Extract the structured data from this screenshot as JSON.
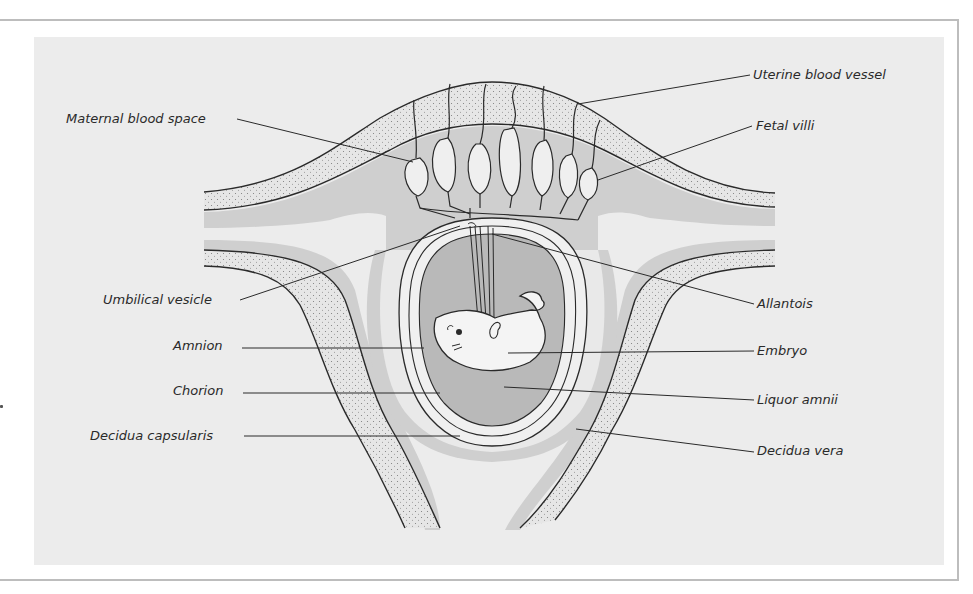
{
  "figure": {
    "type": "anatomical-diagram"
  },
  "labels": {
    "left": [
      {
        "id": "maternal_blood_space",
        "text": "Maternal blood space"
      },
      {
        "id": "umbilical_vesicle",
        "text": "Umbilical vesicle"
      },
      {
        "id": "amnion",
        "text": "Amnion"
      },
      {
        "id": "chorion",
        "text": "Chorion"
      },
      {
        "id": "decidua_capsularis",
        "text": "Decidua capsularis"
      }
    ],
    "right": [
      {
        "id": "uterine_blood_vessel",
        "text": "Uterine blood vessel"
      },
      {
        "id": "fetal_villi",
        "text": "Fetal villi"
      },
      {
        "id": "allantois",
        "text": "Allantois"
      },
      {
        "id": "embryo",
        "text": "Embryo"
      },
      {
        "id": "liquor_amnii",
        "text": "Liquor amnii"
      },
      {
        "id": "decidua_vera",
        "text": "Decidua vera"
      }
    ]
  },
  "colors": {
    "panel_bg": "#ececec",
    "stippled_layer": "#e4e4e4",
    "decidua_grey": "#cfcfcf",
    "amniotic_cavity": "#b9b9b9",
    "embryo_fill": "#f4f4f4",
    "line": "#2a2a2a",
    "frame": "#bdbdbd"
  }
}
